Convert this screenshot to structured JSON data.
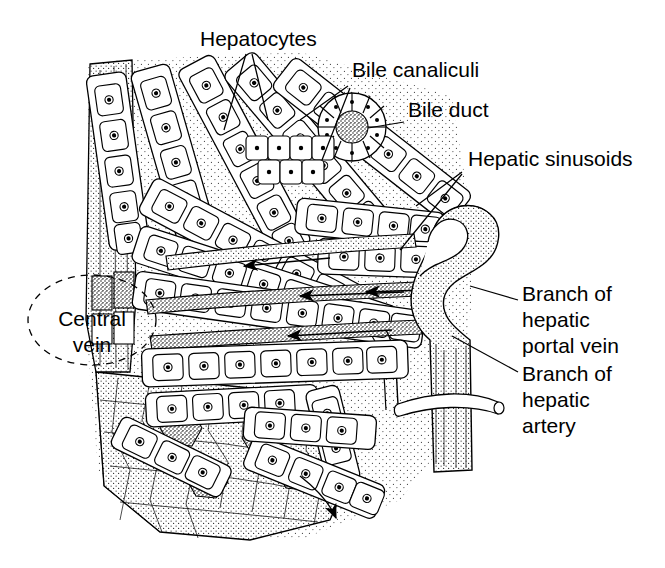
{
  "figure": {
    "background_color": "#ffffff",
    "ink_color": "#000000",
    "style": "black-and-white line drawing with stipple shading"
  },
  "labels": [
    {
      "id": "hepatocytes",
      "text": "Hepatocytes",
      "x": 200,
      "y": 46,
      "anchor": "start",
      "lines": 1
    },
    {
      "id": "bile-canaliculi",
      "text": "Bile canaliculi",
      "x": 352,
      "y": 77,
      "anchor": "start",
      "lines": 1
    },
    {
      "id": "bile-duct",
      "text": "Bile duct",
      "x": 408,
      "y": 117,
      "anchor": "start",
      "lines": 1
    },
    {
      "id": "hepatic-sinusoids",
      "text": "Hepatic sinusoids",
      "x": 468,
      "y": 166,
      "anchor": "start",
      "lines": 1
    },
    {
      "id": "central-vein",
      "text": "Central vein",
      "x": 92,
      "y": 330,
      "anchor": "middle",
      "lines": 2
    },
    {
      "id": "portal-vein",
      "text": "Branch of hepatic portal vein",
      "x": 522,
      "y": 301,
      "anchor": "start",
      "lines": 3
    },
    {
      "id": "hepatic-artery",
      "text": "Branch of hepatic artery",
      "x": 522,
      "y": 374,
      "anchor": "start",
      "lines": 3
    }
  ],
  "label_text": {
    "hepatocytes": "Hepatocytes",
    "bile_canaliculi": "Bile canaliculi",
    "bile_duct": "Bile duct",
    "hepatic_sinusoids": "Hepatic sinusoids",
    "central_vein_line1": "Central",
    "central_vein_line2": "vein",
    "portal_vein_line1": "Branch of",
    "portal_vein_line2": "hepatic",
    "portal_vein_line3": "portal vein",
    "hepatic_artery_line1": "Branch of",
    "hepatic_artery_line2": "hepatic",
    "hepatic_artery_line3": "artery"
  },
  "structures": {
    "hepatocyte_plates": "radiating rows of polygonal cells each with a central nucleus",
    "sinusoids": "stippled channels between hepatocyte plates carrying blood inward",
    "bile_duct": "ring of cuboidal epithelial cells near top right of block",
    "portal_vein": "large stippled vertical vessel at right edge of block",
    "hepatic_artery": "narrow tube crossing the portal vein at lower right",
    "central_vein": "vessel at left edge of block, circled with a dashed ellipse",
    "cut_face": "lower left cut surface showing hepatocytes in cross-section",
    "flow_arrows": "arrows in sinusoids pointing left toward the central vein"
  }
}
